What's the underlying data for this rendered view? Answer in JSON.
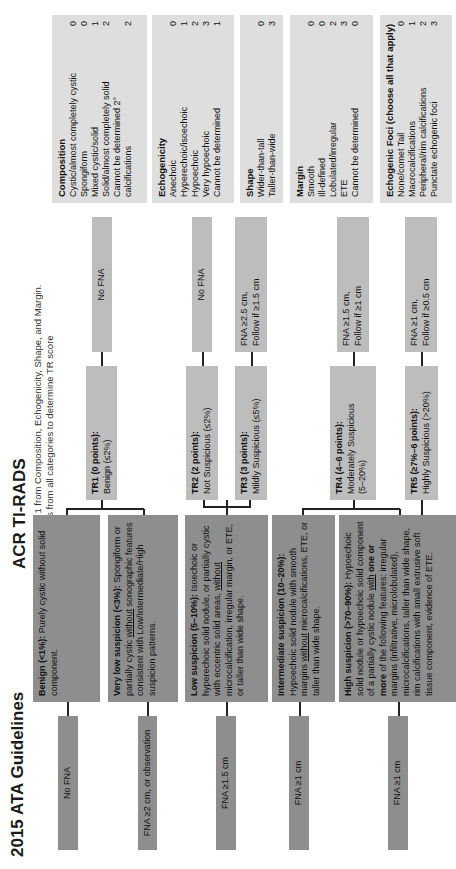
{
  "ata": {
    "title": "2015 ATA Guidelines",
    "categories": [
      {
        "label_bold": "Benign (<1%):",
        "label_rest": " Purely cystic without solid component.",
        "recommendation": "No FNA"
      },
      {
        "label_bold": "Very low suspicion (<3%):",
        "label_rest_a": " Spongiform or partially cystic ",
        "label_underline": "without",
        "label_rest_b": " sonographic features consistent with Low/Intermediate/High suspicion patterns.",
        "recommendation": "FNA ≥2 cm, or observation"
      },
      {
        "label_bold": "Low suspicion (5–10%):",
        "label_rest_a": " Isoechoic or hyperechoic solid nodule, or partially cystic with eccentric solid areas, ",
        "label_underline": "without",
        "label_rest_b": " microcalcification, irregular margin, or ETE, or taller than wide shape.",
        "recommendation": "FNA ≥1.5 cm"
      },
      {
        "label_bold": "Intermediate suspicion (10–20%):",
        "label_rest_a": " Hypoechoic solid nodule with smooth margins ",
        "label_underline": "without",
        "label_rest_b": " microcalcifications, ETE, or taller than wide shape.",
        "recommendation": "FNA ≥1 cm"
      },
      {
        "label_bold": "High suspicion (>70–90%):",
        "label_rest_a": " Hypoechoic solid nodule or hypoechoic solid component of a partially cystic nodule ",
        "label_underline": "with",
        "label_bold2": " one or more",
        "label_rest_b": " of the following features: irregular margins (infiltrative, microlobulated), microcalcifications, taller than wide shape, rim calcifications with small extrusive soft tissue component, evidence of ETE.",
        "recommendation": "FNA ≥1 cm"
      }
    ]
  },
  "tirads": {
    "title": "ACR TI-RADS",
    "instruction_1": "Choose only 1 from Composition, Echogenicity, Shape, and Margin.",
    "instruction_2": "Add points from all categories to determine TR score",
    "levels": [
      {
        "title": "TR1 (0 points):",
        "desc": "Benign (≤2%)",
        "recommendation": "No FNA"
      },
      {
        "title": "TR2 (2 points):",
        "desc": "Not Suspicious (≤2%)",
        "recommendation": "No FNA"
      },
      {
        "title": "TR3 (3 points):",
        "desc": "Mildly Suspicious (≤5%)",
        "recommendation_1": "FNA ≥2.5 cm,",
        "recommendation_2": "Follow if ≥1.5 cm"
      },
      {
        "title": "TR4 (4–6 points):",
        "desc": "Moderately Suspicious",
        "desc2": "(5–20%)",
        "recommendation_1": "FNA ≥1.5 cm,",
        "recommendation_2": "Follow if ≥1 cm"
      },
      {
        "title": "TR5 (≥7%–6 points):",
        "desc": "Highly Suspicious (>20%)",
        "recommendation_1": "FNA ≥1 cm,",
        "recommendation_2": "Follow if ≥0.5 cm"
      }
    ],
    "categories": [
      {
        "title": "Composition",
        "items": [
          {
            "label": "Cystic/almost completely cystic",
            "points": "0"
          },
          {
            "label": "Spongiform",
            "points": "0"
          },
          {
            "label": "Mixed cystic/solid",
            "points": "1"
          },
          {
            "label": "Solid/almost completely solid",
            "points": "2"
          },
          {
            "label": "Cannot be determined 2°",
            "points": ""
          },
          {
            "label": "calcifications",
            "points": "2"
          }
        ]
      },
      {
        "title": "Echogenicity",
        "items": [
          {
            "label": "Anechoic",
            "points": "0"
          },
          {
            "label": "Hyperechoic/isoechoic",
            "points": "1"
          },
          {
            "label": "Hypoechoic",
            "points": "2"
          },
          {
            "label": "Very hypoechoic",
            "points": "3"
          },
          {
            "label": "Cannot be determined",
            "points": "1"
          }
        ]
      },
      {
        "title": "Shape",
        "items": [
          {
            "label": "Wider-than-tall",
            "points": "0"
          },
          {
            "label": "Taller-than-wide",
            "points": "3"
          }
        ]
      },
      {
        "title": "Margin",
        "items": [
          {
            "label": "Smooth",
            "points": "0"
          },
          {
            "label": "Ill-defined",
            "points": "0"
          },
          {
            "label": "Lobulated/irregular",
            "points": "2"
          },
          {
            "label": "ETE",
            "points": "3"
          },
          {
            "label": "Cannot be determined",
            "points": "0"
          }
        ]
      },
      {
        "title": "Echogenic Foci (choose all that apply)",
        "items": [
          {
            "label": "None/comet Tail",
            "points": "0"
          },
          {
            "label": "Macrocalcifications",
            "points": "1"
          },
          {
            "label": "Peripheral/rim calcifications",
            "points": "2"
          },
          {
            "label": "Punctate echogenic foci",
            "points": "3"
          }
        ]
      }
    ]
  },
  "colors": {
    "dark_box": "#8e8e8e",
    "mid_box": "#bdbdbd",
    "light_box": "#dedede",
    "connector": "#222222"
  }
}
